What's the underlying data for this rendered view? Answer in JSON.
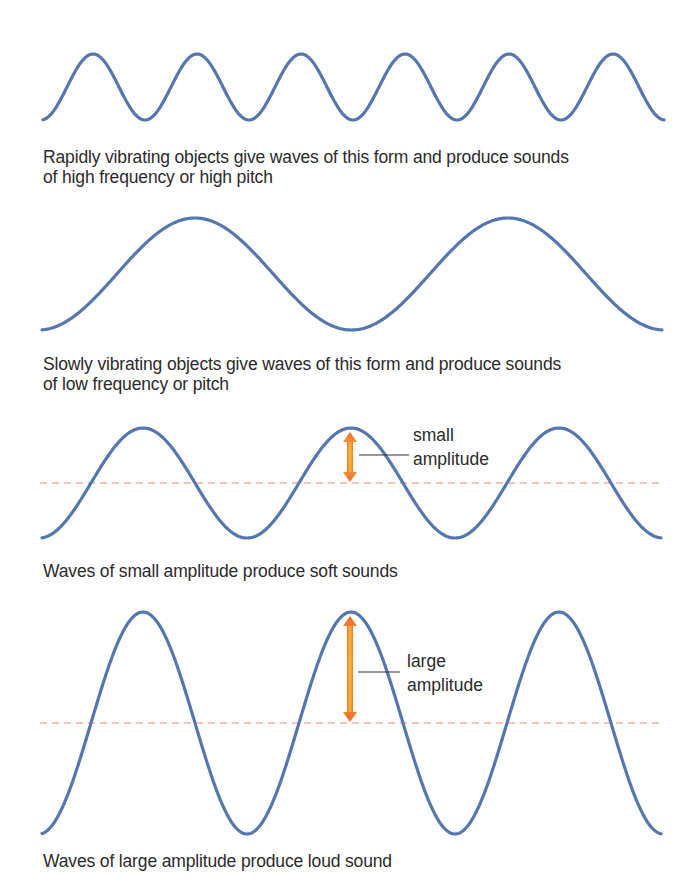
{
  "colors": {
    "wave": "#5577b0",
    "baseline": "#f08a6a",
    "arrow_outer": "#f26a2a",
    "arrow_inner": "#f9c23c",
    "leader": "#333333",
    "text": "#2b2b2b"
  },
  "panels": [
    {
      "id": "high-frequency",
      "caption_lines": [
        "Rapidly vibrating objects give waves of this form and produce sounds",
        "of high frequency or high pitch"
      ]
    },
    {
      "id": "low-frequency",
      "caption_lines": [
        "Slowly vibrating objects give waves of this form and produce sounds",
        "of low frequency or pitch"
      ]
    },
    {
      "id": "small-amplitude",
      "caption_lines": [
        "Waves of small amplitude produce soft sounds"
      ],
      "callout": [
        "small",
        "amplitude"
      ]
    },
    {
      "id": "large-amplitude",
      "caption_lines": [
        "Waves of large amplitude produce loud sound"
      ],
      "callout": [
        "large",
        "amplitude"
      ]
    }
  ],
  "chart_data": [
    {
      "type": "line",
      "title": "High frequency wave",
      "description": "Sine wave, 6 peaks",
      "x_start": 43,
      "x_end": 664,
      "center_y": 87,
      "amplitude": 33,
      "period": 104,
      "first_peak_x": 93,
      "peaks": 6,
      "baseline_shown": false
    },
    {
      "type": "line",
      "title": "Low frequency wave",
      "description": "Sine wave, 2 peaks",
      "x_start": 42,
      "x_end": 662,
      "center_y": 274,
      "amplitude": 56,
      "period": 313,
      "first_peak_x": 195,
      "peaks": 2,
      "baseline_shown": false
    },
    {
      "type": "line",
      "title": "Small amplitude wave",
      "description": "Sine wave, 3 peaks, with dashed equilibrium line and amplitude arrow",
      "x_start": 42,
      "x_end": 661,
      "center_y": 483,
      "amplitude": 55,
      "period": 208,
      "first_peak_x": 143,
      "peaks": 3,
      "baseline_shown": true,
      "arrow": {
        "x": 350,
        "label": "small amplitude"
      }
    },
    {
      "type": "line",
      "title": "Large amplitude wave",
      "description": "Sine wave, 3 peaks, with dashed equilibrium line and amplitude arrow",
      "x_start": 42,
      "x_end": 661,
      "center_y": 723,
      "amplitude": 111,
      "period": 208,
      "first_peak_x": 143,
      "peaks": 3,
      "baseline_shown": true,
      "arrow": {
        "x": 350,
        "label": "large amplitude"
      }
    }
  ]
}
